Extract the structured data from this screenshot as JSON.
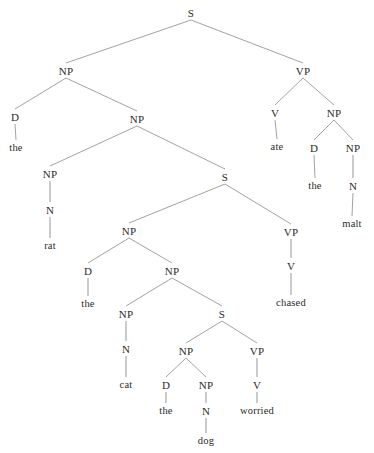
{
  "diagram": {
    "type": "syntax-tree",
    "sentence": "the rat the cat the dog worried chased ate the malt",
    "colors": {
      "background": "#ffffff",
      "text": "#2b2b2b",
      "edge": "#8a8a8a"
    },
    "nodes": [
      {
        "id": "n0",
        "label": "S",
        "kind": "category",
        "x": 191,
        "y": 13
      },
      {
        "id": "n1",
        "label": "NP",
        "kind": "category",
        "x": 66,
        "y": 71
      },
      {
        "id": "n2",
        "label": "VP",
        "kind": "category",
        "x": 303,
        "y": 71
      },
      {
        "id": "n3",
        "label": "D",
        "kind": "category",
        "x": 15,
        "y": 117
      },
      {
        "id": "n4",
        "label": "NP",
        "kind": "category",
        "x": 137,
        "y": 119
      },
      {
        "id": "n5",
        "label": "the",
        "kind": "terminal",
        "x": 16,
        "y": 148
      },
      {
        "id": "n6",
        "label": "V",
        "kind": "category",
        "x": 275,
        "y": 113
      },
      {
        "id": "n7",
        "label": "NP",
        "kind": "category",
        "x": 334,
        "y": 113
      },
      {
        "id": "n8",
        "label": "ate",
        "kind": "terminal",
        "x": 277,
        "y": 147
      },
      {
        "id": "n9",
        "label": "D",
        "kind": "category",
        "x": 314,
        "y": 148
      },
      {
        "id": "n10",
        "label": "NP",
        "kind": "category",
        "x": 353,
        "y": 148
      },
      {
        "id": "n11",
        "label": "the",
        "kind": "terminal",
        "x": 315,
        "y": 186
      },
      {
        "id": "n12",
        "label": "N",
        "kind": "category",
        "x": 353,
        "y": 186
      },
      {
        "id": "n13",
        "label": "malt",
        "kind": "terminal",
        "x": 352,
        "y": 224
      },
      {
        "id": "n14",
        "label": "NP",
        "kind": "category",
        "x": 50,
        "y": 174
      },
      {
        "id": "n15",
        "label": "S",
        "kind": "category",
        "x": 225,
        "y": 177
      },
      {
        "id": "n16",
        "label": "N",
        "kind": "category",
        "x": 50,
        "y": 210
      },
      {
        "id": "n17",
        "label": "rat",
        "kind": "terminal",
        "x": 50,
        "y": 246
      },
      {
        "id": "n18",
        "label": "NP",
        "kind": "category",
        "x": 129,
        "y": 231
      },
      {
        "id": "n19",
        "label": "VP",
        "kind": "category",
        "x": 291,
        "y": 232
      },
      {
        "id": "n20",
        "label": "D",
        "kind": "category",
        "x": 88,
        "y": 271
      },
      {
        "id": "n21",
        "label": "NP",
        "kind": "category",
        "x": 172,
        "y": 271
      },
      {
        "id": "n22",
        "label": "the",
        "kind": "terminal",
        "x": 88,
        "y": 304
      },
      {
        "id": "n23",
        "label": "V",
        "kind": "category",
        "x": 291,
        "y": 266
      },
      {
        "id": "n24",
        "label": "chased",
        "kind": "terminal",
        "x": 291,
        "y": 303
      },
      {
        "id": "n25",
        "label": "NP",
        "kind": "category",
        "x": 126,
        "y": 314
      },
      {
        "id": "n26",
        "label": "S",
        "kind": "category",
        "x": 222,
        "y": 314
      },
      {
        "id": "n27",
        "label": "N",
        "kind": "category",
        "x": 126,
        "y": 349
      },
      {
        "id": "n28",
        "label": "NP",
        "kind": "category",
        "x": 186,
        "y": 351
      },
      {
        "id": "n29",
        "label": "VP",
        "kind": "category",
        "x": 257,
        "y": 351
      },
      {
        "id": "n30",
        "label": "cat",
        "kind": "terminal",
        "x": 126,
        "y": 385
      },
      {
        "id": "n31",
        "label": "D",
        "kind": "category",
        "x": 166,
        "y": 385
      },
      {
        "id": "n32",
        "label": "NP",
        "kind": "category",
        "x": 206,
        "y": 385
      },
      {
        "id": "n33",
        "label": "V",
        "kind": "category",
        "x": 257,
        "y": 385
      },
      {
        "id": "n34",
        "label": "the",
        "kind": "terminal",
        "x": 166,
        "y": 411
      },
      {
        "id": "n35",
        "label": "N",
        "kind": "category",
        "x": 206,
        "y": 411
      },
      {
        "id": "n36",
        "label": "worried",
        "kind": "terminal",
        "x": 257,
        "y": 411
      },
      {
        "id": "n37",
        "label": "dog",
        "kind": "terminal",
        "x": 206,
        "y": 441
      }
    ],
    "edges": [
      {
        "from": "n0",
        "to": "n1"
      },
      {
        "from": "n0",
        "to": "n2"
      },
      {
        "from": "n1",
        "to": "n3"
      },
      {
        "from": "n1",
        "to": "n4"
      },
      {
        "from": "n3",
        "to": "n5"
      },
      {
        "from": "n2",
        "to": "n6"
      },
      {
        "from": "n2",
        "to": "n7"
      },
      {
        "from": "n6",
        "to": "n8"
      },
      {
        "from": "n7",
        "to": "n9"
      },
      {
        "from": "n7",
        "to": "n10"
      },
      {
        "from": "n9",
        "to": "n11"
      },
      {
        "from": "n10",
        "to": "n12"
      },
      {
        "from": "n12",
        "to": "n13"
      },
      {
        "from": "n4",
        "to": "n14"
      },
      {
        "from": "n4",
        "to": "n15"
      },
      {
        "from": "n14",
        "to": "n16"
      },
      {
        "from": "n16",
        "to": "n17"
      },
      {
        "from": "n15",
        "to": "n18"
      },
      {
        "from": "n15",
        "to": "n19"
      },
      {
        "from": "n18",
        "to": "n20"
      },
      {
        "from": "n18",
        "to": "n21"
      },
      {
        "from": "n20",
        "to": "n22"
      },
      {
        "from": "n19",
        "to": "n23"
      },
      {
        "from": "n23",
        "to": "n24"
      },
      {
        "from": "n21",
        "to": "n25"
      },
      {
        "from": "n21",
        "to": "n26"
      },
      {
        "from": "n25",
        "to": "n27"
      },
      {
        "from": "n27",
        "to": "n30"
      },
      {
        "from": "n26",
        "to": "n28"
      },
      {
        "from": "n26",
        "to": "n29"
      },
      {
        "from": "n28",
        "to": "n31"
      },
      {
        "from": "n28",
        "to": "n32"
      },
      {
        "from": "n31",
        "to": "n34"
      },
      {
        "from": "n32",
        "to": "n35"
      },
      {
        "from": "n35",
        "to": "n37"
      },
      {
        "from": "n29",
        "to": "n33"
      },
      {
        "from": "n33",
        "to": "n36"
      }
    ]
  }
}
